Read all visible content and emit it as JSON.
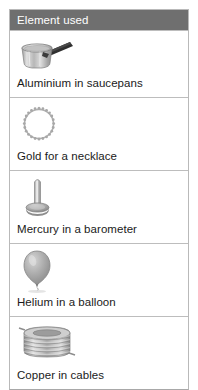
{
  "table": {
    "header": "Element used",
    "rows": [
      {
        "icon_name": "saucepan-icon",
        "icon": "saucepan",
        "label": "Aluminium in saucepans"
      },
      {
        "icon_name": "necklace-icon",
        "icon": "necklace",
        "label": "Gold for a necklace"
      },
      {
        "icon_name": "barometer-icon",
        "icon": "barometer",
        "label": "Mercury in a barometer"
      },
      {
        "icon_name": "balloon-icon",
        "icon": "balloon",
        "label": "Helium in a balloon"
      },
      {
        "icon_name": "wire-coil-icon",
        "icon": "wire-coil",
        "label": "Copper in cables"
      }
    ]
  },
  "colors": {
    "header_background": "#6f6f6f",
    "header_text": "#ffffff",
    "border": "#bdbdbd",
    "text": "#1a1a1a",
    "page_background": "#ffffff",
    "icon_gray_light": "#d8d8d8",
    "icon_gray_mid": "#a9a9a9",
    "icon_gray_dark": "#6a6a6a",
    "icon_outline": "#8c8c8c"
  }
}
